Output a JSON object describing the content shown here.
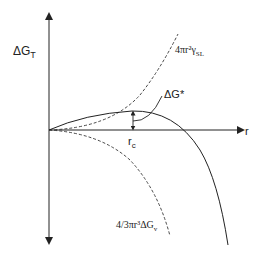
{
  "diagram": {
    "y_axis": {
      "label": "ΔG",
      "subscript": "T"
    },
    "x_axis": {
      "label": "r"
    },
    "curves": {
      "surface": {
        "label_main": "4πr²γ",
        "label_sub": "SL",
        "style": "dashed"
      },
      "volume": {
        "label_main": "4/3πr³ΔG",
        "label_sub": "v",
        "style": "dashed"
      },
      "total": {
        "label": "ΔG*",
        "style": "solid"
      }
    },
    "critical_radius": {
      "label_main": "r",
      "label_sub": "c"
    },
    "colors": {
      "line": "#222222",
      "background": "#ffffff"
    }
  }
}
